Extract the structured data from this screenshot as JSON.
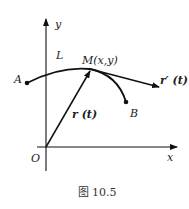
{
  "figure": {
    "caption": "图 10.5",
    "axes": {
      "x_label": "x",
      "y_label": "y",
      "origin_label": "O"
    },
    "curve": {
      "name_label": "L",
      "start_label": "A",
      "end_label": "B"
    },
    "point": {
      "label": "M(x,y)"
    },
    "vectors": {
      "position_label": "r (t)",
      "tangent_label": "r′ (t)"
    },
    "colors": {
      "stroke": "#111111",
      "background": "#ffffff"
    }
  }
}
